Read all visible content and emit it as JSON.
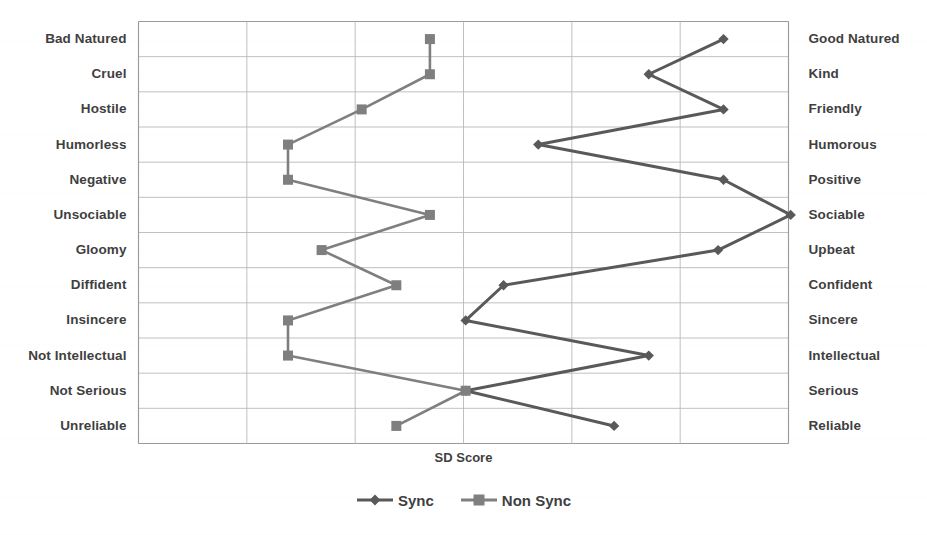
{
  "chart_data": {
    "type": "line",
    "title": "",
    "xlabel": "SD Score",
    "ylabel": "",
    "orientation": "horizontal",
    "grid": true,
    "legend_position": "bottom",
    "xlim": [
      1,
      7
    ],
    "xticks": [
      1,
      2,
      3,
      4,
      5,
      6,
      7
    ],
    "xtick_labels_visible": false,
    "categories_left": [
      "Bad Natured",
      "Cruel",
      "Hostile",
      "Humorless",
      "Negative",
      "Unsociable",
      "Gloomy",
      "Diffident",
      "Insincere",
      "Not Intellectual",
      "Not Serious",
      "Unreliable"
    ],
    "categories_right": [
      "Good Natured",
      "Kind",
      "Friendly",
      "Humorous",
      "Positive",
      "Sociable",
      "Upbeat",
      "Confident",
      "Sincere",
      "Intellectual",
      "Serious",
      "Reliable"
    ],
    "series": [
      {
        "name": "Sync",
        "marker": "diamond",
        "color": "#595959",
        "values": [
          6.4,
          5.71,
          6.4,
          4.69,
          6.4,
          7.02,
          6.35,
          4.37,
          4.02,
          5.71,
          4.02,
          5.39
        ]
      },
      {
        "name": "Non Sync",
        "marker": "square",
        "color": "#7f7f7f",
        "values": [
          3.69,
          3.69,
          3.06,
          2.38,
          2.38,
          3.69,
          2.69,
          3.38,
          2.38,
          2.38,
          4.02,
          3.38
        ]
      }
    ]
  },
  "legend": {
    "items": [
      {
        "label": "Sync",
        "marker": "diamond",
        "color": "#595959"
      },
      {
        "label": "Non Sync",
        "marker": "square",
        "color": "#7f7f7f"
      }
    ]
  }
}
